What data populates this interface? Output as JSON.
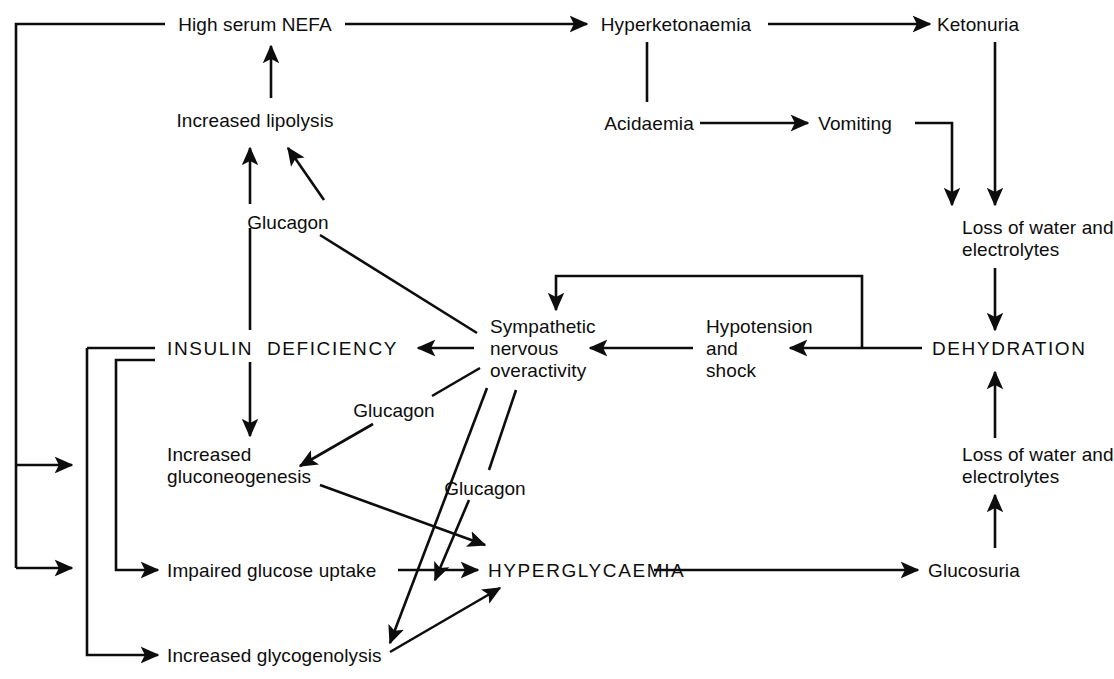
{
  "diagram": {
    "stroke_color": "#0d0d0d",
    "background_color": "#ffffff",
    "nodes": [
      {
        "id": "high_serum_nefa",
        "label": "High serum NEFA",
        "style": "normal",
        "x": 255,
        "y": 14,
        "align": "center"
      },
      {
        "id": "hyperketonaemia",
        "label": "Hyperketonaemia",
        "style": "normal",
        "x": 676,
        "y": 14,
        "align": "center"
      },
      {
        "id": "ketonuria",
        "label": "Ketonuria",
        "style": "normal",
        "x": 978,
        "y": 14,
        "align": "center"
      },
      {
        "id": "increased_lipolysis",
        "label": "Increased lipolysis",
        "style": "normal",
        "x": 255,
        "y": 110,
        "align": "center"
      },
      {
        "id": "acidaemia",
        "label": "Acidaemia",
        "style": "normal",
        "x": 649,
        "y": 113,
        "align": "center"
      },
      {
        "id": "vomiting",
        "label": "Vomiting",
        "style": "normal",
        "x": 855,
        "y": 113,
        "align": "center"
      },
      {
        "id": "glucagon_lipolysis",
        "label": "Glucagon",
        "style": "glu",
        "x": 288,
        "y": 212,
        "align": "center"
      },
      {
        "id": "loss_water_top",
        "label": "Loss of water and\nelectrolytes",
        "style": "normal",
        "x": 962,
        "y": 217,
        "align": "left"
      },
      {
        "id": "insulin_deficiency",
        "label": "INSULIN  DEFICIENCY",
        "style": "caps",
        "x": 167,
        "y": 338,
        "align": "left"
      },
      {
        "id": "sympathetic",
        "label": "Sympathetic\nnervous\noveractivity",
        "style": "normal",
        "x": 490,
        "y": 316,
        "align": "left"
      },
      {
        "id": "hypotension_shock",
        "label": "Hypotension\nand\nshock",
        "style": "normal",
        "x": 706,
        "y": 316,
        "align": "left"
      },
      {
        "id": "dehydration",
        "label": "DEHYDRATION",
        "style": "caps",
        "x": 932,
        "y": 338,
        "align": "left"
      },
      {
        "id": "glucagon_gluconeo",
        "label": "Glucagon",
        "style": "glu",
        "x": 394,
        "y": 400,
        "align": "center"
      },
      {
        "id": "increased_gluconeo",
        "label": "Increased\ngluconeogenesis",
        "style": "normal",
        "x": 167,
        "y": 444,
        "align": "left"
      },
      {
        "id": "glucagon_hyper",
        "label": "Glucagon",
        "style": "glu",
        "x": 485,
        "y": 478,
        "align": "center"
      },
      {
        "id": "loss_water_bottom",
        "label": "Loss of water and\nelectrolytes",
        "style": "normal",
        "x": 962,
        "y": 444,
        "align": "left"
      },
      {
        "id": "impaired_glucose_uptake",
        "label": "Impaired glucose uptake",
        "style": "normal",
        "x": 167,
        "y": 560,
        "align": "left"
      },
      {
        "id": "hyperglycaemia",
        "label": "HYPERGLYCAEMIA",
        "style": "caps",
        "x": 488,
        "y": 560,
        "align": "left"
      },
      {
        "id": "glucosuria",
        "label": "Glucosuria",
        "style": "normal",
        "x": 928,
        "y": 560,
        "align": "left"
      },
      {
        "id": "increased_glycogenolysis",
        "label": "Increased glycogenolysis",
        "style": "normal",
        "x": 167,
        "y": 645,
        "align": "left"
      }
    ],
    "edges": [
      {
        "id": "edge-nefa-hyperketonaemia",
        "from": "high_serum_nefa",
        "to": "hyperketonaemia"
      },
      {
        "id": "edge-hyperketonaemia-ketonuria",
        "from": "hyperketonaemia",
        "to": "ketonuria"
      },
      {
        "id": "edge-lipolysis-nefa",
        "from": "increased_lipolysis",
        "to": "high_serum_nefa"
      },
      {
        "id": "edge-acidaemia-hyperketonaemia",
        "from": "acidaemia",
        "to": "hyperketonaemia"
      },
      {
        "id": "edge-acidaemia-vomiting",
        "from": "acidaemia",
        "to": "vomiting"
      },
      {
        "id": "edge-vomiting-losswater",
        "from": "vomiting",
        "to": "loss_water_top"
      },
      {
        "id": "edge-ketonuria-losswater",
        "from": "ketonuria",
        "to": "loss_water_top"
      },
      {
        "id": "edge-losswater-dehydration",
        "from": "loss_water_top",
        "to": "dehydration"
      },
      {
        "id": "edge-losswaterbottom-dehydration",
        "from": "loss_water_bottom",
        "to": "dehydration"
      },
      {
        "id": "edge-glucosuria-losswaterbottom",
        "from": "glucosuria",
        "to": "loss_water_bottom"
      },
      {
        "id": "edge-dehydration-hypotension",
        "from": "dehydration",
        "to": "hypotension_shock"
      },
      {
        "id": "edge-dehydration-sympathetic",
        "from": "dehydration",
        "to": "sympathetic"
      },
      {
        "id": "edge-hypotension-sympathetic",
        "from": "hypotension_shock",
        "to": "sympathetic"
      },
      {
        "id": "edge-sympathetic-insulin",
        "from": "sympathetic",
        "to": "insulin_deficiency"
      },
      {
        "id": "edge-sympathetic-lipolysis",
        "from": "sympathetic",
        "to": "increased_lipolysis",
        "label": "glucagon_lipolysis"
      },
      {
        "id": "edge-sympathetic-gluconeo",
        "from": "sympathetic",
        "to": "increased_gluconeo",
        "label": "glucagon_gluconeo"
      },
      {
        "id": "edge-sympathetic-glycogenolysis",
        "from": "sympathetic",
        "to": "increased_glycogenolysis"
      },
      {
        "id": "edge-sympathetic-hyperglycaemia",
        "from": "sympathetic",
        "to": "hyperglycaemia",
        "label": "glucagon_hyper"
      },
      {
        "id": "edge-insulin-lipolysis",
        "from": "insulin_deficiency",
        "to": "increased_lipolysis"
      },
      {
        "id": "edge-insulin-gluconeo",
        "from": "insulin_deficiency",
        "to": "increased_gluconeo"
      },
      {
        "id": "edge-insulin-nefa-loop",
        "from": "insulin_deficiency",
        "to": "high_serum_nefa"
      },
      {
        "id": "edge-insulin-impaired-uptake",
        "from": "insulin_deficiency",
        "to": "impaired_glucose_uptake"
      },
      {
        "id": "edge-insulin-glycogenolysis",
        "from": "insulin_deficiency",
        "to": "increased_glycogenolysis"
      },
      {
        "id": "edge-impaired-hyperglycaemia",
        "from": "impaired_glucose_uptake",
        "to": "hyperglycaemia"
      },
      {
        "id": "edge-gluconeo-hyperglycaemia",
        "from": "increased_gluconeo",
        "to": "hyperglycaemia"
      },
      {
        "id": "edge-glycogenolysis-hyperglycaemia",
        "from": "increased_glycogenolysis",
        "to": "hyperglycaemia"
      },
      {
        "id": "edge-hyperglycaemia-glucosuria",
        "from": "hyperglycaemia",
        "to": "glucosuria"
      }
    ]
  }
}
